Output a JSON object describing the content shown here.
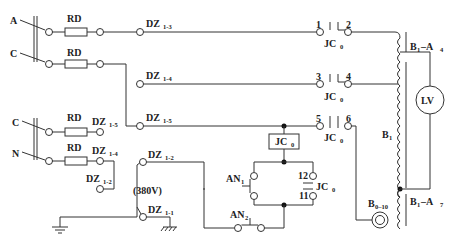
{
  "diagram": {
    "type": "electrical-schematic",
    "supply": {
      "upper": {
        "phase_a": "A",
        "phase_c": "C"
      },
      "lower": {
        "phase_c": "C",
        "neutral": "N"
      }
    },
    "fuse_label": "RD",
    "terminals": {
      "dz13": {
        "main": "DZ",
        "sub": "1-3"
      },
      "dz14": {
        "main": "DZ",
        "sub": "1-4"
      },
      "dz15": {
        "main": "DZ",
        "sub": "1-5"
      },
      "dz15_left": {
        "main": "DZ",
        "sub": "1-5"
      },
      "dz14_left": {
        "main": "DZ",
        "sub": "1-4"
      },
      "dz12_left": {
        "main": "DZ",
        "sub": "1-2"
      },
      "dz12": {
        "main": "DZ",
        "sub": "1-2"
      },
      "dz11": {
        "main": "DZ",
        "sub": "1-1"
      }
    },
    "voltage_label": "(380V)",
    "contactor": {
      "main": "JC",
      "sub": "0",
      "contacts": [
        {
          "left": "1",
          "right": "2"
        },
        {
          "left": "3",
          "right": "4"
        },
        {
          "left": "5",
          "right": "6"
        }
      ],
      "aux_contacts": {
        "top": "12",
        "bottom": "11"
      }
    },
    "buttons": {
      "an1": {
        "main": "AN",
        "sub": "1"
      },
      "an2": {
        "main": "AN",
        "sub": "2"
      }
    },
    "transformer": {
      "main": "B",
      "sub": "1",
      "tap_a4": {
        "main": "B",
        "sub1": "1",
        "dash": "–A",
        "sub2": "4"
      },
      "tap_a7": {
        "main": "B",
        "sub1": "1",
        "dash": "–A",
        "sub2": "7"
      }
    },
    "meter": "LV",
    "current_transformer": {
      "main": "B",
      "sub": "0–10"
    }
  }
}
